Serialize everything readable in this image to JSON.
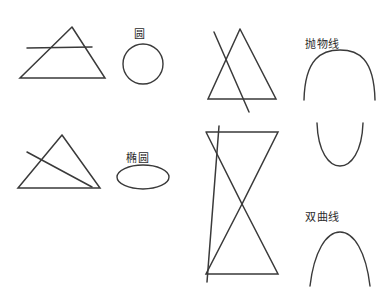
{
  "diagram": {
    "background_color": "#ffffff",
    "ink_color": "#3a3a3a",
    "labels": {
      "circle": "圆",
      "ellipse": "椭圆",
      "parabola": "抛物线",
      "hyperbola": "双曲线"
    },
    "figures": [
      {
        "name": "cone-circle",
        "cone_type": "single-cone",
        "cut": "horizontal",
        "result": "圆"
      },
      {
        "name": "cone-ellipse",
        "cone_type": "single-cone",
        "cut": "oblique",
        "result": "椭圆"
      },
      {
        "name": "cone-parabola",
        "cone_type": "single-cone",
        "cut": "parallel-to-side",
        "result": "抛物线"
      },
      {
        "name": "cone-hyperbola",
        "cone_type": "double-cone",
        "cut": "near-vertical",
        "result": "双曲线"
      }
    ]
  }
}
